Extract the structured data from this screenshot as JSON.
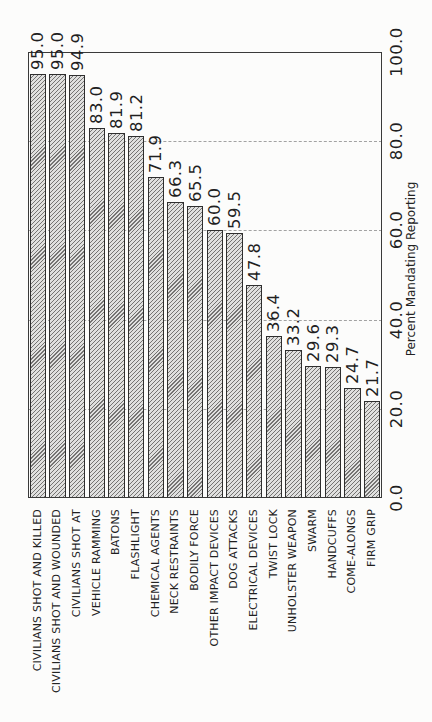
{
  "figure": {
    "background": "#fcfcfb"
  },
  "chart_data": {
    "type": "bar",
    "title": "",
    "categories": [
      "CIVILIANS SHOT AND KILLED",
      "CIVILIANS SHOT AND WOUNDED",
      "CIVILIANS SHOT AT",
      "VEHICLE RAMMING",
      "BATONS",
      "FLASHLIGHT",
      "CHEMICAL AGENTS",
      "NECK RESTRAINTS",
      "BODILY FORCE",
      "OTHER IMPACT DEVICES",
      "DOG ATTACKS",
      "ELECTRICAL DEVICES",
      "TWIST LOCK",
      "UNHOLSTER WEAPON",
      "SWARM",
      "HANDCUFFS",
      "COME-ALONGS",
      "FIRM GRIP"
    ],
    "values": [
      95.0,
      95.0,
      94.9,
      83.0,
      81.9,
      81.2,
      71.9,
      66.3,
      65.5,
      60.0,
      59.5,
      47.8,
      36.4,
      33.2,
      29.6,
      29.3,
      24.7,
      21.7
    ],
    "value_labels": [
      "95.0",
      "95.0",
      "94.9",
      "83.0",
      "81.9",
      "81.2",
      "71.9",
      "66.3",
      "65.5",
      "60.0",
      "59.5",
      "47.8",
      "36.4",
      "33.2",
      "29.6",
      "29.3",
      "24.7",
      "21.7"
    ],
    "xlabel": "",
    "ylabel": "Percent Mandating Reporting",
    "ylim": [
      0,
      100
    ],
    "yticks": [
      0,
      20,
      40,
      60,
      80,
      100
    ],
    "ytick_labels": [
      "0.0",
      "20.0",
      "40.0",
      "60.0",
      "80.0",
      "100.0"
    ],
    "grid": {
      "show": true,
      "style": "dashed",
      "at": [
        20,
        40,
        60,
        80
      ]
    },
    "legend": {
      "show": false
    },
    "style": {
      "bar_fill": "#e0e0df",
      "hatch": "forward-diagonal",
      "hatch_color": "#757473",
      "bar_edge_color": "#2e2e2e",
      "frame_color": "#3a3a3a",
      "grid_color": "#a2a2a2",
      "text_color": "#1f1f1f"
    }
  }
}
